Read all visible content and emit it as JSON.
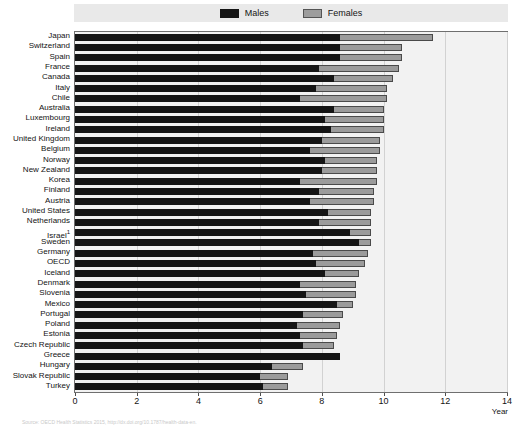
{
  "legend": {
    "entries": [
      {
        "label": "Males",
        "key": "males",
        "color": "#151515"
      },
      {
        "label": "Females",
        "key": "females",
        "color": "#9b9b9b"
      }
    ]
  },
  "axis": {
    "title": "Year",
    "ticks": [
      0,
      2,
      4,
      6,
      8,
      10,
      12,
      14
    ],
    "min": 0,
    "max": 14
  },
  "footnote": "Source: OECD Health Statistics 2015, http://dx.doi.org/10.1787/health-data-en.",
  "chart_data": {
    "type": "bar",
    "orientation": "horizontal",
    "stacked": false,
    "title": "",
    "xlabel": "Year",
    "ylabel": "",
    "xlim": [
      0,
      14
    ],
    "grid": true,
    "legend_position": "top",
    "categories": [
      "Japan",
      "Switzerland",
      "Spain",
      "France",
      "Canada",
      "Italy",
      "Chile",
      "Australia",
      "Luxembourg",
      "Ireland",
      "United Kingdom",
      "Belgium",
      "Norway",
      "New Zealand",
      "Korea",
      "Finland",
      "Austria",
      "United States",
      "Netherlands",
      "Israel",
      "Sweden",
      "Germany",
      "OECD",
      "Iceland",
      "Denmark",
      "Slovenia",
      "Mexico",
      "Portugal",
      "Poland",
      "Estonia",
      "Czech Republic",
      "Greece",
      "Hungary",
      "Slovak Republic",
      "Turkey"
    ],
    "category_footnote_marks": {
      "Israel": "1"
    },
    "series": [
      {
        "name": "Males",
        "values": [
          8.6,
          8.6,
          8.6,
          7.9,
          8.4,
          7.8,
          7.3,
          8.4,
          8.1,
          8.3,
          8.0,
          7.6,
          8.1,
          8.0,
          7.3,
          7.9,
          7.6,
          8.2,
          7.9,
          8.9,
          9.2,
          7.7,
          7.8,
          8.1,
          7.3,
          7.5,
          8.5,
          7.4,
          7.2,
          7.3,
          7.4,
          8.6,
          6.4,
          6.0,
          6.1
        ]
      },
      {
        "name": "Females",
        "values": [
          11.6,
          10.6,
          10.6,
          10.5,
          10.3,
          10.1,
          10.1,
          10.0,
          10.0,
          10.0,
          9.9,
          9.9,
          9.8,
          9.8,
          9.8,
          9.7,
          9.7,
          9.6,
          9.6,
          9.6,
          9.6,
          9.5,
          9.4,
          9.2,
          9.1,
          9.1,
          9.0,
          8.7,
          8.6,
          8.5,
          8.4,
          8.6,
          7.4,
          6.9,
          6.9
        ]
      }
    ]
  }
}
